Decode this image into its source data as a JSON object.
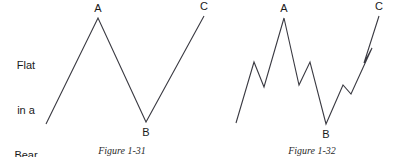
{
  "figure": {
    "side_label": {
      "lines": [
        "Flat",
        "in a",
        "Bear",
        "Market"
      ],
      "line1": "Flat",
      "line2": "in a",
      "line3": "Bear",
      "line4": "Market"
    },
    "line_color": "#3a3a42",
    "background_color": "#ffffff",
    "text_color": "#1a1a1a"
  },
  "chart_data": [
    {
      "type": "line",
      "title": "Figure 1-31",
      "subtitle": "Flat in a Bear Market",
      "xlabel": "",
      "ylabel": "",
      "grid": false,
      "legend": "none",
      "annotations": [
        {
          "label": "A",
          "x": 98,
          "y": 18,
          "role": "peak"
        },
        {
          "label": "B",
          "x": 146,
          "y": 122,
          "role": "trough"
        },
        {
          "label": "C",
          "x": 204,
          "y": 16,
          "role": "peak"
        }
      ],
      "points": [
        {
          "x": 46,
          "y": 124
        },
        {
          "x": 98,
          "y": 18
        },
        {
          "x": 146,
          "y": 122
        },
        {
          "x": 204,
          "y": 16
        }
      ]
    },
    {
      "type": "line",
      "title": "Figure 1-32",
      "subtitle": "Flat in a Bear Market (detailed waves)",
      "xlabel": "",
      "ylabel": "",
      "grid": false,
      "legend": "none",
      "annotations": [
        {
          "label": "A",
          "x": 284,
          "y": 18,
          "role": "peak"
        },
        {
          "label": "B",
          "x": 326,
          "y": 124,
          "role": "trough"
        },
        {
          "label": "C",
          "x": 379,
          "y": 16,
          "role": "peak"
        }
      ],
      "points": [
        {
          "x": 236,
          "y": 123
        },
        {
          "x": 254,
          "y": 62
        },
        {
          "x": 264,
          "y": 87
        },
        {
          "x": 284,
          "y": 18
        },
        {
          "x": 299,
          "y": 85
        },
        {
          "x": 310,
          "y": 62
        },
        {
          "x": 326,
          "y": 124
        },
        {
          "x": 343,
          "y": 85
        },
        {
          "x": 351,
          "y": 94
        },
        {
          "x": 372,
          "y": 48
        },
        {
          "x": 364,
          "y": 63
        },
        {
          "x": 379,
          "y": 16
        }
      ]
    }
  ],
  "captions": {
    "left": "Figure 1-31",
    "right": "Figure 1-32"
  },
  "labels": {
    "left_a": "A",
    "left_b": "B",
    "left_c": "C",
    "right_a": "A",
    "right_b": "B",
    "right_c": "C"
  }
}
